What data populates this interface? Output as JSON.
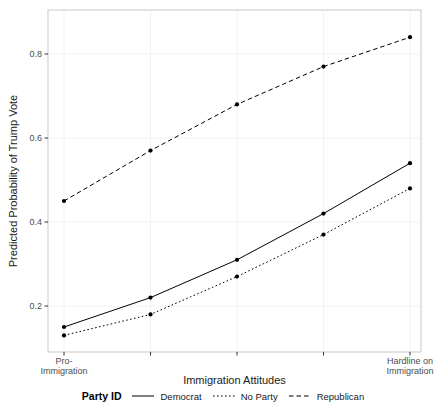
{
  "chart_data": {
    "type": "line",
    "title": "",
    "xlabel": "Immigration Attitudes",
    "ylabel": "Predicted Probability of Trump Vote",
    "legend": {
      "title": "Party ID",
      "position": "bottom"
    },
    "x_ticks": [
      {
        "label_lines": [
          "Pro-",
          "Immigration"
        ]
      },
      {
        "label_lines": []
      },
      {
        "label_lines": []
      },
      {
        "label_lines": []
      },
      {
        "label_lines": [
          "Hardline on",
          "Immigration"
        ]
      }
    ],
    "y_ticks": [
      {
        "value": 0.2,
        "label": "0.2"
      },
      {
        "value": 0.4,
        "label": "0.4"
      },
      {
        "value": 0.6,
        "label": "0.6"
      },
      {
        "value": 0.8,
        "label": "0.8"
      }
    ],
    "ylim": [
      0.09,
      0.9
    ],
    "series": [
      {
        "name": "Democrat",
        "linetype": "solid",
        "values": [
          0.15,
          0.22,
          0.31,
          0.42,
          0.54
        ]
      },
      {
        "name": "No Party",
        "linetype": "dotted",
        "values": [
          0.13,
          0.18,
          0.27,
          0.37,
          0.48
        ]
      },
      {
        "name": "Republican",
        "linetype": "dashed",
        "values": [
          0.45,
          0.57,
          0.68,
          0.77,
          0.84
        ]
      }
    ],
    "grid": "major-faint",
    "point_marker": "filled-circle"
  },
  "colors": {
    "line": "#000000",
    "point": "#000000",
    "tick_label": "#4d4d4d",
    "tick_mark": "#333333",
    "axis_title": "#1a1a1a",
    "panel_border": "#c9c9c9",
    "gridline": "#f2f2f2",
    "background": "#ffffff"
  }
}
